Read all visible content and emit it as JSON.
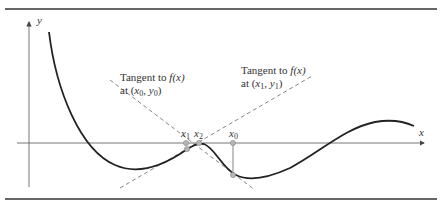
{
  "diagram": {
    "type": "newton-raphson-illustration",
    "axes": {
      "x_label": "x",
      "y_label": "y"
    },
    "points": [
      {
        "name": "x1",
        "label_base": "x",
        "label_sub": "1"
      },
      {
        "name": "x2",
        "label_base": "x",
        "label_sub": "2"
      },
      {
        "name": "x0",
        "label_base": "x",
        "label_sub": "0"
      }
    ],
    "annotations": [
      {
        "id": "tangent-x0",
        "line1_prefix": "Tangent to ",
        "line1_func": "f(x)",
        "line2_prefix": "at (",
        "line2_x": "x",
        "line2_xsub": "0",
        "line2_sep": ", ",
        "line2_y": "y",
        "line2_ysub": "0",
        "line2_suffix": ")"
      },
      {
        "id": "tangent-x1",
        "line1_prefix": "Tangent to ",
        "line1_func": "f(x)",
        "line2_prefix": "at (",
        "line2_x": "x",
        "line2_xsub": "1",
        "line2_sep": ", ",
        "line2_y": "y",
        "line2_ysub": "1",
        "line2_suffix": ")"
      }
    ],
    "colors": {
      "curve": "#222222",
      "axis": "#666666",
      "tangent": "#777777",
      "point_fill": "#b5b5b5",
      "rule": "#333333"
    }
  }
}
